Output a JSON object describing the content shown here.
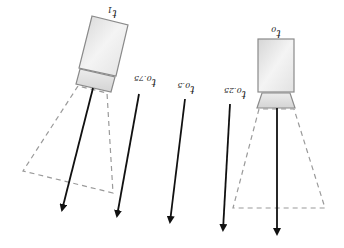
{
  "diagram": {
    "colors": {
      "camera_body_light": "#f2f2f2",
      "camera_body_dark": "#cfcfcf",
      "camera_outline": "#8a8a8a",
      "frustum": "#9a9a9a",
      "arrow": "#111111",
      "label": "#222222"
    },
    "cameras": [
      {
        "id": "cam-t1",
        "label_base": "t",
        "label_sub": "1"
      },
      {
        "id": "cam-t0",
        "label_base": "t",
        "label_sub": "0"
      }
    ],
    "direction_labels": [
      {
        "label_base": "t",
        "label_sub": "0.75"
      },
      {
        "label_base": "t",
        "label_sub": "0.5"
      },
      {
        "label_base": "t",
        "label_sub": "0.25"
      }
    ]
  }
}
